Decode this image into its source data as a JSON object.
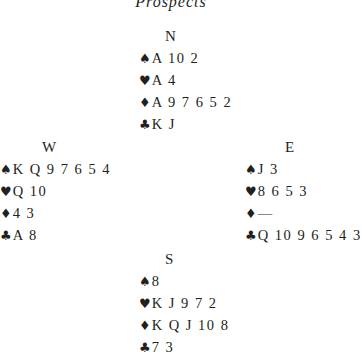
{
  "title": "Prospects",
  "suit_symbols": {
    "spades": "♠",
    "hearts": "♥",
    "diamonds": "♦",
    "clubs": "♣"
  },
  "hands": {
    "north": {
      "label": "N",
      "spades": "A 10 2",
      "hearts": "A 4",
      "diamonds": "A 9 7 6 5 2",
      "clubs": "K J"
    },
    "west": {
      "label": "W",
      "spades": "K Q 9 7 6 5 4",
      "hearts": "Q 10",
      "diamonds": "4 3",
      "clubs": "A 8"
    },
    "east": {
      "label": "E",
      "spades": "J 3",
      "hearts": "8 6 5 3",
      "diamonds": "—",
      "clubs": "Q 10 9 6 5 4 3"
    },
    "south": {
      "label": "S",
      "spades": "8",
      "hearts": "K J 9 7 2",
      "diamonds": "K Q J 10 8",
      "clubs": "7 3"
    }
  }
}
